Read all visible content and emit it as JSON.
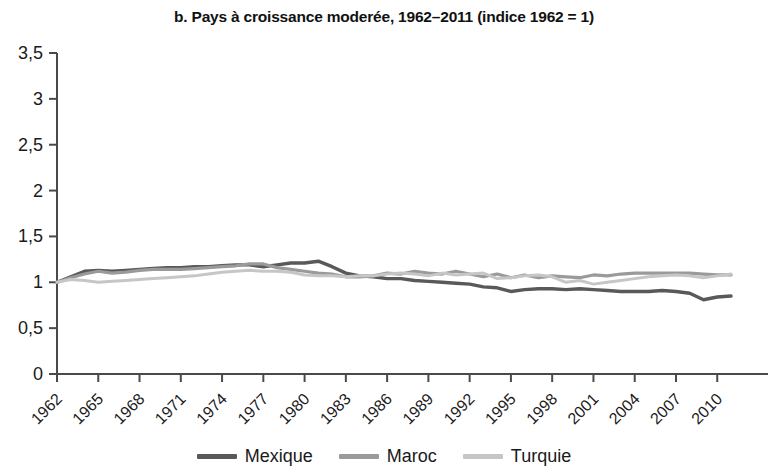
{
  "chart_data": {
    "type": "line",
    "title": "b. Pays à croissance moderée, 1962–2011 (indice 1962 = 1)",
    "xlabel": "",
    "ylabel": "",
    "xlim": [
      1962,
      2011
    ],
    "ylim": [
      0,
      3.5
    ],
    "grid": false,
    "legend_position": "bottom",
    "ytick_labels": [
      "0",
      "0,5",
      "1",
      "1,5",
      "2",
      "2,5",
      "3",
      "3,5"
    ],
    "ytick_values": [
      0,
      0.5,
      1,
      1.5,
      2,
      2.5,
      3,
      3.5
    ],
    "xtick_labels": [
      "1962",
      "1965",
      "1968",
      "1971",
      "1974",
      "1977",
      "1980",
      "1983",
      "1986",
      "1989",
      "1992",
      "1995",
      "1998",
      "2001",
      "2004",
      "2007",
      "2010"
    ],
    "xtick_values": [
      1962,
      1965,
      1968,
      1971,
      1974,
      1977,
      1980,
      1983,
      1986,
      1989,
      1992,
      1995,
      1998,
      2001,
      2004,
      2007,
      2010
    ],
    "x": [
      1962,
      1963,
      1964,
      1965,
      1966,
      1967,
      1968,
      1969,
      1970,
      1971,
      1972,
      1973,
      1974,
      1975,
      1976,
      1977,
      1978,
      1979,
      1980,
      1981,
      1982,
      1983,
      1984,
      1985,
      1986,
      1987,
      1988,
      1989,
      1990,
      1991,
      1992,
      1993,
      1994,
      1995,
      1996,
      1997,
      1998,
      1999,
      2000,
      2001,
      2002,
      2003,
      2004,
      2005,
      2006,
      2007,
      2008,
      2009,
      2010,
      2011
    ],
    "series": [
      {
        "name": "Mexique",
        "color": "#595959",
        "width": 3.4,
        "values": [
          1.0,
          1.06,
          1.12,
          1.13,
          1.12,
          1.13,
          1.14,
          1.15,
          1.16,
          1.16,
          1.17,
          1.17,
          1.18,
          1.19,
          1.19,
          1.17,
          1.19,
          1.21,
          1.21,
          1.23,
          1.17,
          1.1,
          1.07,
          1.06,
          1.04,
          1.04,
          1.02,
          1.01,
          1.0,
          0.99,
          0.98,
          0.95,
          0.94,
          0.9,
          0.92,
          0.93,
          0.93,
          0.92,
          0.93,
          0.92,
          0.91,
          0.9,
          0.9,
          0.9,
          0.91,
          0.9,
          0.88,
          0.81,
          0.84,
          0.85
        ]
      },
      {
        "name": "Maroc",
        "color": "#9a9a9a",
        "width": 3.2,
        "values": [
          1.0,
          1.05,
          1.09,
          1.12,
          1.1,
          1.11,
          1.13,
          1.14,
          1.14,
          1.14,
          1.15,
          1.16,
          1.17,
          1.18,
          1.2,
          1.2,
          1.16,
          1.14,
          1.12,
          1.1,
          1.09,
          1.06,
          1.06,
          1.07,
          1.1,
          1.09,
          1.12,
          1.1,
          1.09,
          1.12,
          1.09,
          1.06,
          1.09,
          1.05,
          1.08,
          1.05,
          1.07,
          1.06,
          1.05,
          1.08,
          1.07,
          1.09,
          1.1,
          1.1,
          1.1,
          1.1,
          1.1,
          1.09,
          1.08,
          1.08
        ]
      },
      {
        "name": "Turquie",
        "color": "#c6c6c6",
        "width": 3.0,
        "values": [
          1.0,
          1.03,
          1.02,
          1.0,
          1.01,
          1.02,
          1.03,
          1.04,
          1.05,
          1.06,
          1.07,
          1.09,
          1.11,
          1.12,
          1.13,
          1.12,
          1.12,
          1.11,
          1.08,
          1.07,
          1.07,
          1.06,
          1.07,
          1.07,
          1.09,
          1.1,
          1.09,
          1.07,
          1.1,
          1.08,
          1.09,
          1.1,
          1.04,
          1.05,
          1.07,
          1.08,
          1.06,
          1.0,
          1.02,
          0.98,
          1.0,
          1.02,
          1.04,
          1.06,
          1.07,
          1.08,
          1.07,
          1.05,
          1.07,
          1.09
        ]
      }
    ]
  },
  "legend": {
    "items": [
      {
        "label": "Mexique",
        "color": "#595959"
      },
      {
        "label": "Maroc",
        "color": "#9a9a9a"
      },
      {
        "label": "Turquie",
        "color": "#c6c6c6"
      }
    ]
  },
  "axes": {
    "axis_color": "#4a4a4a"
  }
}
